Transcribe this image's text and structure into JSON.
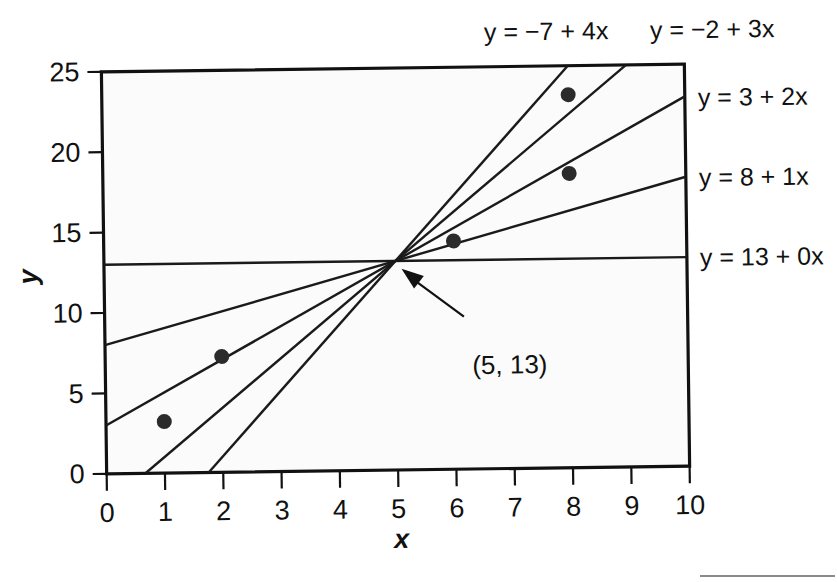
{
  "chart_data": {
    "type": "line",
    "title": "",
    "subtitle": "",
    "xlabel": "x",
    "ylabel": "y",
    "xlim": [
      0,
      10
    ],
    "ylim": [
      0,
      25
    ],
    "xticks": [
      "0",
      "1",
      "2",
      "3",
      "4",
      "5",
      "6",
      "7",
      "8",
      "9",
      "10"
    ],
    "yticks": [
      "0",
      "5",
      "10",
      "15",
      "20",
      "25"
    ],
    "xtick_values": [
      0,
      1,
      2,
      3,
      4,
      5,
      6,
      7,
      8,
      9,
      10
    ],
    "ytick_values": [
      0,
      5,
      10,
      15,
      20,
      25
    ],
    "grid": false,
    "legend_position": "inline-line-labels",
    "common_point": {
      "x": 5,
      "y": 13,
      "label": "(5, 13)"
    },
    "series": [
      {
        "name": "y = 13 + 0x",
        "label": "y = 13 + 0x",
        "intercept": 13,
        "slope": 0,
        "label_position": "right",
        "label_at_y": 13.3
      },
      {
        "name": "y = 8 + 1x",
        "label": "y = 8 + 1x",
        "intercept": 8,
        "slope": 1,
        "label_position": "right",
        "label_at_y": 18.5
      },
      {
        "name": "y = 3 + 2x",
        "label": "y = 3 + 2x",
        "intercept": 3,
        "slope": 2,
        "label_position": "right",
        "label_at_y": 23.4
      },
      {
        "name": "y = -2 + 3x",
        "label": "y = −2 + 3x",
        "intercept": -2,
        "slope": 3,
        "label_position": "top",
        "label_at_x": 8.55
      },
      {
        "name": "y = -7 + 4x",
        "label": "y = −7 + 4x",
        "intercept": -7,
        "slope": 4,
        "label_position": "top",
        "label_at_x": 6.3
      }
    ],
    "points": [
      {
        "x": 1,
        "y": 3.2
      },
      {
        "x": 2,
        "y": 7.2
      },
      {
        "x": 6,
        "y": 14.2
      },
      {
        "x": 8,
        "y": 18.3
      },
      {
        "x": 8,
        "y": 23.2
      }
    ],
    "annotations": [
      {
        "text": "(5, 13)",
        "points_to_x": 5,
        "points_to_y": 13,
        "text_x": 6.3,
        "text_y": 9.6
      }
    ],
    "colors": {
      "line": "#1a1a1a",
      "point": "#2b2b2b",
      "frame": "#111111",
      "plot_background": "#fbfbfb",
      "page_background": "#ffffff",
      "text": "#111111"
    }
  },
  "labels": {
    "equation_top_left": "y = −7 + 4x",
    "equation_top_right": "y = −2 + 3x",
    "equation_right_1": "y = 3 + 2x",
    "equation_right_2": "y = 8 + 1x",
    "equation_right_3": "y = 13 + 0x",
    "axis_x": "x",
    "axis_y": "y",
    "convergence": "(5, 13)"
  }
}
